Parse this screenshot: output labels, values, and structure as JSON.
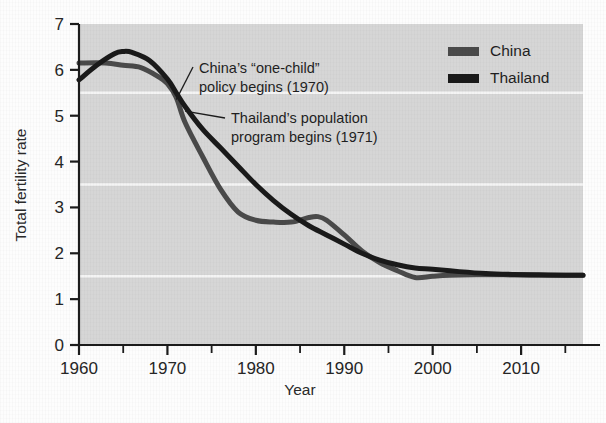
{
  "chart_data": {
    "type": "line",
    "title": "",
    "xlabel": "Year",
    "ylabel": "Total fertility rate",
    "xlim": [
      1960,
      2017
    ],
    "ylim": [
      0,
      7
    ],
    "grid": true,
    "gridlines_y": [
      1.5,
      3.5,
      5.5
    ],
    "legend_position": "top-right",
    "x_ticks_major": [
      1960,
      1970,
      1980,
      1990,
      2000,
      2010
    ],
    "x_tick_labels": [
      "1960",
      "1970",
      "1980",
      "1990",
      "2000",
      "2010"
    ],
    "x_ticks_minor": [
      1965,
      1975,
      1985,
      1995,
      2005,
      2015
    ],
    "y_ticks": [
      0,
      1,
      2,
      3,
      4,
      5,
      6,
      7
    ],
    "y_tick_labels": [
      "0",
      "1",
      "2",
      "3",
      "4",
      "5",
      "6",
      "7"
    ],
    "series": [
      {
        "name": "China",
        "color": "#4a4a4a",
        "x": [
          1960,
          1963,
          1965,
          1967,
          1969,
          1970,
          1971,
          1972,
          1974,
          1976,
          1978,
          1980,
          1982,
          1984,
          1986,
          1987,
          1988,
          1990,
          1992,
          1994,
          1996,
          1998,
          2000,
          2002,
          2005,
          2008,
          2011,
          2014,
          2017
        ],
        "values": [
          6.15,
          6.15,
          6.1,
          6.05,
          5.85,
          5.7,
          5.4,
          4.85,
          4.1,
          3.4,
          2.9,
          2.72,
          2.68,
          2.68,
          2.78,
          2.8,
          2.72,
          2.4,
          2.05,
          1.8,
          1.62,
          1.47,
          1.5,
          1.52,
          1.53,
          1.53,
          1.52,
          1.52,
          1.52
        ]
      },
      {
        "name": "Thailand",
        "color": "#1a1a1a",
        "x": [
          1960,
          1962,
          1964,
          1965,
          1966,
          1968,
          1970,
          1971,
          1972,
          1974,
          1976,
          1978,
          1980,
          1982,
          1984,
          1986,
          1988,
          1990,
          1992,
          1994,
          1996,
          1998,
          2000,
          2003,
          2006,
          2009,
          2012,
          2015,
          2017
        ],
        "values": [
          5.78,
          6.1,
          6.35,
          6.4,
          6.38,
          6.2,
          5.8,
          5.5,
          5.2,
          4.7,
          4.3,
          3.9,
          3.5,
          3.15,
          2.85,
          2.6,
          2.4,
          2.2,
          2.0,
          1.85,
          1.75,
          1.68,
          1.65,
          1.6,
          1.56,
          1.54,
          1.53,
          1.52,
          1.52
        ]
      }
    ],
    "annotations": [
      {
        "id": "china-policy",
        "lines": [
          "China’s “one-child”",
          "policy begins (1970)"
        ],
        "target_year": 1971,
        "target_value": 5.35
      },
      {
        "id": "thailand-program",
        "lines": [
          "Thailand’s population",
          "program begins (1971)"
        ],
        "target_year": 1972,
        "target_value": 5.1
      }
    ]
  },
  "legend": {
    "items": [
      {
        "label": "China",
        "color": "#4a4a4a"
      },
      {
        "label": "Thailand",
        "color": "#1a1a1a"
      }
    ]
  },
  "style": {
    "plot_background": "#d6d6d6",
    "gridline_color": "#f4f4f4",
    "axis_color": "#1c1c1c",
    "page_background": "#fdfdfd"
  }
}
